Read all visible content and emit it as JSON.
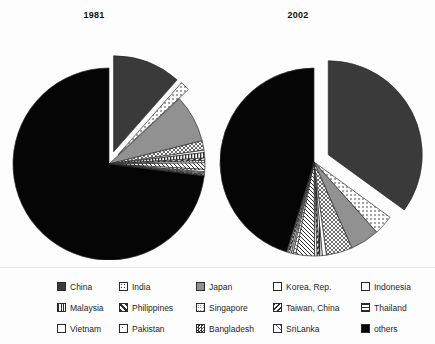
{
  "chart_data": {
    "type": "pie",
    "title": "",
    "charts": [
      {
        "title": "1981",
        "categories": [
          "China",
          "India",
          "Japan",
          "Korea, Rep.",
          "Indonesia",
          "Malaysia",
          "Philippines",
          "Singapore",
          "Taiwan, China",
          "Thailand",
          "Vietnam",
          "Pakistan",
          "Bangladesh",
          "SriLanka",
          "others"
        ],
        "values": [
          11.5,
          1.6,
          8.0,
          1.6,
          0.4,
          0.9,
          0.4,
          0.4,
          1.1,
          0.4,
          0.2,
          0.2,
          0.2,
          0.1,
          73.0
        ],
        "exploded": [
          "China",
          "India"
        ],
        "start_angle_deg": -90,
        "legend_position": "bottom",
        "grid": false
      },
      {
        "title": "2002",
        "categories": [
          "China",
          "India",
          "Japan",
          "Korea, Rep.",
          "Indonesia",
          "Malaysia",
          "Philippines",
          "Singapore",
          "Taiwan, China",
          "Thailand",
          "Vietnam",
          "Pakistan",
          "Bangladesh",
          "SriLanka",
          "others"
        ],
        "values": [
          35.0,
          3.4,
          5.0,
          4.5,
          0.7,
          0.5,
          0.4,
          0.4,
          3.2,
          0.5,
          0.3,
          0.3,
          0.3,
          0.2,
          45.3
        ],
        "exploded": [
          "China"
        ],
        "start_angle_deg": -90,
        "legend_position": "bottom",
        "grid": false
      }
    ],
    "xlabel": "",
    "ylabel": ""
  },
  "titles": {
    "left": "1981",
    "right": "2002"
  },
  "colors": {
    "china": "#3a3a3a",
    "japan": "#919191",
    "others": "#050505",
    "outline": "#2b2b2b",
    "background": "#fdfdfd",
    "text": "#1a1a1a"
  },
  "legend": {
    "rows": [
      [
        {
          "label": "China",
          "pattern": "solid-darkgray"
        },
        {
          "label": "India",
          "pattern": "dots-sparse"
        },
        {
          "label": "Japan",
          "pattern": "solid-gray"
        },
        {
          "label": "Korea, Rep.",
          "pattern": "crosshatch-diamond"
        },
        {
          "label": "Indonesia",
          "pattern": "empty-white"
        }
      ],
      [
        {
          "label": "Malaysia",
          "pattern": "vertical-stripes"
        },
        {
          "label": "Philippines",
          "pattern": "diagonal-thick"
        },
        {
          "label": "Singapore",
          "pattern": "dots-fine"
        },
        {
          "label": "Taiwan, China",
          "pattern": "diagonal-backslash"
        },
        {
          "label": "Thailand",
          "pattern": "wave-hatch"
        }
      ],
      [
        {
          "label": "Vietnam",
          "pattern": "grid-fine"
        },
        {
          "label": "Pakistan",
          "pattern": "corner-dot"
        },
        {
          "label": "Bangladesh",
          "pattern": "checker"
        },
        {
          "label": "SriLanka",
          "pattern": "crosshatch-light"
        },
        {
          "label": "others",
          "pattern": "solid-black"
        }
      ]
    ]
  }
}
